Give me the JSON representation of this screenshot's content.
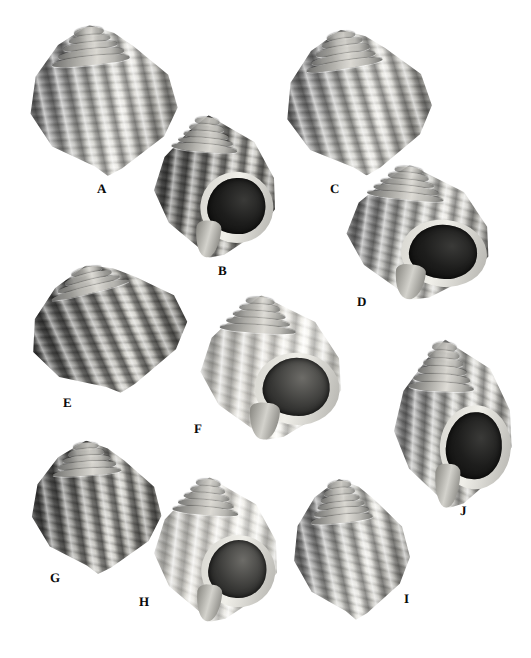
{
  "plate": {
    "kind": "specimen-photo-plate",
    "background_color": "#ffffff",
    "label_color": "#0a0a0a",
    "width": 531,
    "height": 658,
    "palette": {
      "shell_light": "#e3e2dd",
      "shell_mid": "#a6a5a0",
      "shell_dark": "#4d4d4d",
      "aperture_dark": "#101010"
    },
    "specimens": [
      {
        "label": "A",
        "label_x": 97,
        "label_y": 182,
        "x": 28,
        "y": 24,
        "w": 150,
        "h": 152,
        "rotate": -6,
        "tone": "mid",
        "view": "dorsal",
        "aperture": false,
        "spire_whorls": 5
      },
      {
        "label": "B",
        "label_x": 218,
        "label_y": 264,
        "x": 152,
        "y": 116,
        "w": 126,
        "h": 142,
        "rotate": 5,
        "tone": "dark",
        "view": "apertural",
        "aperture": true,
        "spire_whorls": 5
      },
      {
        "label": "C",
        "label_x": 330,
        "label_y": 182,
        "x": 284,
        "y": 28,
        "w": 148,
        "h": 148,
        "rotate": -9,
        "tone": "mid",
        "view": "dorsal",
        "aperture": false,
        "spire_whorls": 5
      },
      {
        "label": "D",
        "label_x": 357,
        "label_y": 295,
        "x": 344,
        "y": 166,
        "w": 148,
        "h": 134,
        "rotate": 6,
        "tone": "mid",
        "view": "apertural",
        "aperture": true,
        "spire_whorls": 5
      },
      {
        "label": "E",
        "label_x": 63,
        "label_y": 396,
        "x": 28,
        "y": 262,
        "w": 160,
        "h": 132,
        "rotate": -14,
        "tone": "dark",
        "view": "dorsal",
        "aperture": false,
        "spire_whorls": 4
      },
      {
        "label": "F",
        "label_x": 194,
        "label_y": 422,
        "x": 198,
        "y": 296,
        "w": 146,
        "h": 144,
        "rotate": 4,
        "tone": "pale",
        "view": "apertural",
        "aperture": true,
        "spire_whorls": 5
      },
      {
        "label": "G",
        "label_x": 50,
        "label_y": 571,
        "x": 30,
        "y": 440,
        "w": 132,
        "h": 134,
        "rotate": -4,
        "tone": "dark",
        "view": "dorsal",
        "aperture": false,
        "spire_whorls": 5
      },
      {
        "label": "H",
        "label_x": 139,
        "label_y": 595,
        "x": 152,
        "y": 478,
        "w": 128,
        "h": 144,
        "rotate": 5,
        "tone": "pale",
        "view": "apertural",
        "aperture": true,
        "spire_whorls": 5
      },
      {
        "label": "I",
        "label_x": 404,
        "label_y": 592,
        "x": 292,
        "y": 478,
        "w": 118,
        "h": 142,
        "rotate": -6,
        "tone": "mid",
        "view": "dorsal",
        "aperture": false,
        "spire_whorls": 6
      },
      {
        "label": "J",
        "label_x": 460,
        "label_y": 504,
        "x": 392,
        "y": 340,
        "w": 122,
        "h": 168,
        "rotate": 3,
        "tone": "mid",
        "view": "apertural",
        "aperture": true,
        "spire_whorls": 6
      }
    ]
  }
}
